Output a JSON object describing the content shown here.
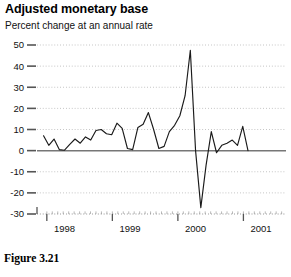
{
  "chart_data": {
    "type": "line",
    "title": "Adjusted monetary base",
    "subtitle": "Percent change at an annual rate",
    "caption": "Figure 3.21",
    "xlabel": "",
    "ylabel": "",
    "ylim": [
      -30,
      50
    ],
    "xlim": [
      1997.6,
      2001.4
    ],
    "ytick_labels": [
      "50",
      "40",
      "30",
      "20",
      "10",
      "0",
      "-10",
      "-20",
      "-30"
    ],
    "ytick_values": [
      50,
      40,
      30,
      20,
      10,
      0,
      -10,
      -20,
      -30
    ],
    "xtick_labels": [
      "1998",
      "1999",
      "2000",
      "2001"
    ],
    "xtick_values": [
      1998,
      1999,
      2000,
      2001
    ],
    "grid": true,
    "grid_style": "dotted",
    "legend": "none",
    "zero_line": true,
    "line_color": "#1a1a1a",
    "grid_color": "#999999",
    "axis_color": "#555555",
    "x": [
      1997.7,
      1997.78,
      1997.86,
      1997.94,
      1998.02,
      1998.1,
      1998.18,
      1998.26,
      1998.34,
      1998.42,
      1998.5,
      1998.58,
      1998.66,
      1998.74,
      1998.82,
      1998.9,
      1998.98,
      1999.06,
      1999.14,
      1999.22,
      1999.3,
      1999.38,
      1999.46,
      1999.54,
      1999.62,
      1999.7,
      1999.78,
      1999.86,
      1999.94,
      2000.02,
      2000.1,
      2000.18,
      2000.26,
      2000.34,
      2000.42,
      2000.5,
      2000.58,
      2000.66,
      2000.74,
      2000.82
    ],
    "values": [
      7.0,
      2.5,
      5.5,
      0.5,
      0.2,
      3.0,
      5.5,
      3.5,
      6.5,
      5.0,
      9.5,
      10.0,
      8.0,
      7.5,
      13.0,
      10.5,
      1.0,
      0.5,
      11.0,
      12.5,
      18.0,
      10.0,
      1.0,
      2.0,
      9.0,
      12.0,
      16.5,
      26.0,
      47.5,
      0.0,
      -27.0,
      -7.0,
      9.0,
      -1.0,
      2.5,
      3.5,
      5.0,
      2.5,
      11.5,
      0.0
    ]
  }
}
